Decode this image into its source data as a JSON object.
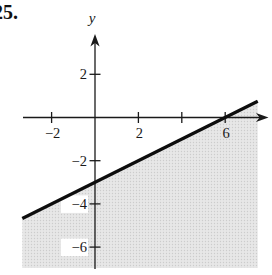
{
  "figure": {
    "problem_number": "25.",
    "y_axis_label": "y"
  },
  "chart_data": {
    "type": "line",
    "boundary_line": {
      "equation": "y = x/2 - 3",
      "slope": 0.5,
      "y_intercept": -3,
      "x_intercept": 6,
      "style": "solid",
      "x_range": [
        -3.35,
        7.5
      ]
    },
    "shaded_region": "below",
    "xlim": [
      -3.3,
      7.95
    ],
    "ylim": [
      -7.0,
      3.5
    ],
    "x_ticks": [
      {
        "value": -2,
        "label": "−2"
      },
      {
        "value": 2,
        "label": "2"
      },
      {
        "value": 4,
        "label": ""
      },
      {
        "value": 6,
        "label": "6"
      }
    ],
    "y_ticks": [
      {
        "value": 2,
        "label": "2"
      },
      {
        "value": -2,
        "label": "−2"
      },
      {
        "value": -4,
        "label": "−4"
      },
      {
        "value": -6,
        "label": "−6"
      }
    ],
    "grid": false,
    "legend": false,
    "colors": {
      "axis": "#1a1a1a",
      "line": "#0d0d0d",
      "shade_base": "#e7e7e7",
      "shade_dot": "#cccccc"
    }
  }
}
